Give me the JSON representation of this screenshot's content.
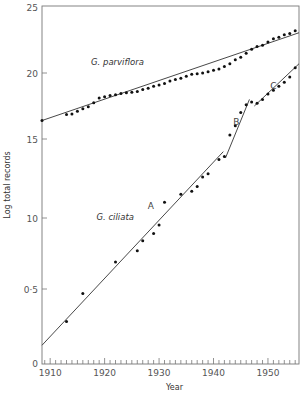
{
  "chart_data": {
    "type": "scatter",
    "title": "",
    "xlabel": "Year",
    "ylabel": "Log total records",
    "xlim": [
      1908.5,
      1955.7
    ],
    "x_ticks": [
      1910,
      1920,
      1930,
      1940,
      1950
    ],
    "x_tick_labels": [
      "1910",
      "1920",
      "1930",
      "1940",
      "1950"
    ],
    "y_tick_labels": [
      "25",
      "20",
      "15",
      "10",
      "0·5",
      "0"
    ],
    "y_tick_values": [
      2.5,
      2.0,
      1.5,
      1.0,
      0.5,
      0
    ],
    "y_tick_pixel": [
      7,
      73,
      139,
      218,
      289,
      363
    ],
    "grid": false,
    "legend": "none (series labelled inline)",
    "annotations": [
      {
        "text": "A",
        "x": 1928.5,
        "y": 1.057
      },
      {
        "text": "B",
        "x": 1944.2,
        "y": 1.605
      },
      {
        "text": "C",
        "x": 1951.0,
        "y": 1.88
      }
    ],
    "series": [
      {
        "name": "G. parviflora",
        "label_pos": {
          "x": 1917.5,
          "y": 2.06
        },
        "points": [
          [
            1908.5,
            1.64
          ],
          [
            1913,
            1.685
          ],
          [
            1914,
            1.69
          ],
          [
            1915,
            1.71
          ],
          [
            1916,
            1.73
          ],
          [
            1917,
            1.745
          ],
          [
            1918,
            1.775
          ],
          [
            1919,
            1.81
          ],
          [
            1920,
            1.82
          ],
          [
            1921,
            1.83
          ],
          [
            1922,
            1.835
          ],
          [
            1923,
            1.845
          ],
          [
            1924,
            1.85
          ],
          [
            1925,
            1.855
          ],
          [
            1926,
            1.86
          ],
          [
            1927,
            1.875
          ],
          [
            1928,
            1.885
          ],
          [
            1929,
            1.9
          ],
          [
            1930,
            1.91
          ],
          [
            1931,
            1.92
          ],
          [
            1932,
            1.94
          ],
          [
            1933,
            1.95
          ],
          [
            1934,
            1.96
          ],
          [
            1935,
            1.975
          ],
          [
            1936,
            1.99
          ],
          [
            1937,
            1.995
          ],
          [
            1938,
            2.0
          ],
          [
            1939,
            2.01
          ],
          [
            1940,
            2.02
          ],
          [
            1941,
            2.03
          ],
          [
            1942,
            2.05
          ],
          [
            1943,
            2.07
          ],
          [
            1944,
            2.1
          ],
          [
            1945,
            2.12
          ],
          [
            1946,
            2.15
          ],
          [
            1947,
            2.18
          ],
          [
            1948,
            2.2
          ],
          [
            1949,
            2.21
          ],
          [
            1950,
            2.235
          ],
          [
            1951,
            2.26
          ],
          [
            1952,
            2.27
          ],
          [
            1953,
            2.29
          ],
          [
            1954,
            2.3
          ],
          [
            1955,
            2.32
          ]
        ],
        "fit_line": [
          [
            1908.5,
            1.64
          ],
          [
            1955.7,
            2.305
          ]
        ]
      },
      {
        "name": "G. ciliata",
        "label_pos": {
          "x": 1918.5,
          "y": 0.985
        },
        "points": [
          [
            1913,
            0.28
          ],
          [
            1916,
            0.47
          ],
          [
            1922,
            0.69
          ],
          [
            1926,
            0.77
          ],
          [
            1927,
            0.84
          ],
          [
            1929,
            0.89
          ],
          [
            1930,
            0.95
          ],
          [
            1931,
            1.1
          ],
          [
            1934,
            1.15
          ],
          [
            1936,
            1.17
          ],
          [
            1937,
            1.2
          ],
          [
            1938,
            1.26
          ],
          [
            1939,
            1.28
          ],
          [
            1941,
            1.37
          ],
          [
            1942,
            1.39
          ],
          [
            1943,
            1.53
          ],
          [
            1944,
            1.6
          ],
          [
            1945,
            1.7
          ],
          [
            1946,
            1.76
          ],
          [
            1947,
            1.78
          ],
          [
            1948,
            1.77
          ],
          [
            1949,
            1.8
          ],
          [
            1950,
            1.84
          ],
          [
            1951,
            1.87
          ],
          [
            1952,
            1.9
          ],
          [
            1953,
            1.93
          ],
          [
            1954,
            1.97
          ],
          [
            1955,
            2.04
          ]
        ],
        "fit_lines": [
          {
            "segment": "A",
            "from": [
              1908.5,
              0.12
            ],
            "to": [
              1941.8,
              1.42
            ]
          },
          {
            "segment": "B",
            "from": [
              1942.2,
              1.38
            ],
            "to": [
              1946.6,
              1.8
            ]
          },
          {
            "segment": "C",
            "from": [
              1947.5,
              1.75
            ],
            "to": [
              1955.7,
              2.07
            ]
          }
        ]
      }
    ]
  }
}
